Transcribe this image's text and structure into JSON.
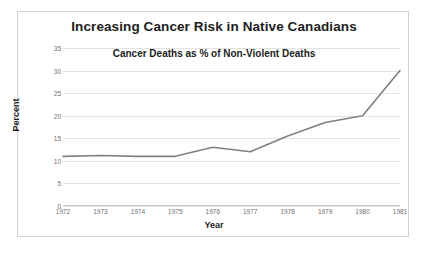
{
  "chart_data": {
    "type": "line",
    "title": "Increasing Cancer Risk in Native Canadians",
    "subtitle": "Cancer Deaths as % of Non-Violent Deaths",
    "xlabel": "Year",
    "ylabel": "Percent",
    "categories": [
      "1972",
      "1973",
      "1974",
      "1975",
      "1976",
      "1977",
      "1978",
      "1979",
      "1980",
      "1981"
    ],
    "values": [
      11,
      11.2,
      11,
      11,
      13,
      12,
      15.5,
      18.5,
      20,
      30
    ],
    "series": [
      {
        "name": "Cancer Deaths as % of Non-Violent Deaths",
        "values": [
          11,
          11.2,
          11,
          11,
          13,
          12,
          15.5,
          18.5,
          20,
          30
        ]
      }
    ],
    "ylim": [
      0,
      35
    ],
    "yticks": [
      "0",
      "5",
      "10",
      "15",
      "20",
      "25",
      "30",
      "35"
    ],
    "ytick_values": [
      0,
      5,
      10,
      15,
      20,
      25,
      30,
      35
    ],
    "grid": true,
    "legend": "none",
    "line_color": "#808080",
    "grid_color": "#e4e4e4",
    "border_color": "#d2d2d2",
    "text_color": "#1d1d1d",
    "tick_text_color": "#6f6f6f"
  }
}
